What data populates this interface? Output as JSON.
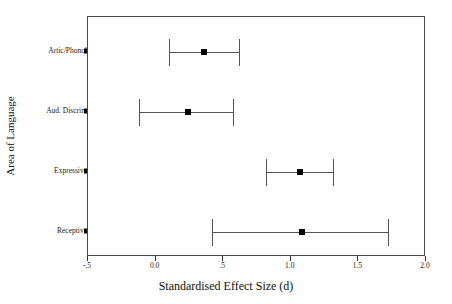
{
  "chart_data": {
    "type": "scatter",
    "orientation": "horizontal",
    "title": "",
    "xlabel": "Standardised Effect Size (d)",
    "ylabel": "Area of Language",
    "xlim": [
      -0.5,
      2.0
    ],
    "xticks": [
      -0.5,
      0.0,
      0.5,
      1.0,
      1.5,
      2.0
    ],
    "xticklabels": [
      "-.5",
      "0.0",
      ".5",
      "1.0",
      "1.5",
      "2.0"
    ],
    "grid": false,
    "legend": null,
    "categories": [
      "Artic/Phonol",
      "Aud. Discrim",
      "Expressive",
      "Receptive"
    ],
    "points": [
      {
        "category": "Artic/Phonol",
        "value": 0.36,
        "ci_low": 0.1,
        "ci_high": 0.62
      },
      {
        "category": "Aud. Discrim",
        "value": 0.24,
        "ci_low": -0.12,
        "ci_high": 0.57
      },
      {
        "category": "Expressive",
        "value": 1.07,
        "ci_low": 0.82,
        "ci_high": 1.31
      },
      {
        "category": "Receptive",
        "value": 1.08,
        "ci_low": 0.42,
        "ci_high": 1.72
      }
    ]
  },
  "axes": {
    "x_title": "Standardised Effect Size (d)",
    "y_title": "Area of Language",
    "x_tick_labels": [
      "-.5",
      "0.0",
      ".5",
      "1.0",
      "1.5",
      "2.0"
    ],
    "y_tick_labels": [
      "Artic/Phonol",
      "Aud. Discrim",
      "Expressive",
      "Receptive"
    ]
  }
}
